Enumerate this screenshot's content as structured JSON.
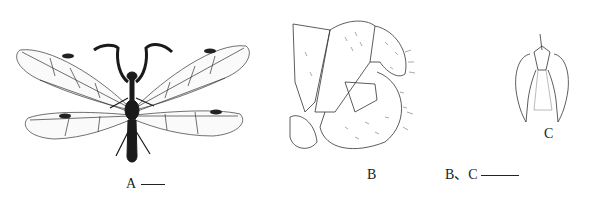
{
  "figure": {
    "panels": [
      {
        "id": "A",
        "label": "A",
        "subject": "whole adult insect, dorsal view (mantispid-like, raptorial forelegs, four net-veined wings)",
        "scale_bar": true
      },
      {
        "id": "B",
        "label": "B",
        "subject": "male genitalia / terminalia, lateral view, setose lobes"
      },
      {
        "id": "C",
        "label": "C",
        "subject": "genital structure, ventral view, outline drawing"
      }
    ],
    "shared_scale_label": "B、C",
    "colors": {
      "ink": "#1a1a1a",
      "background": "#ffffff"
    }
  }
}
